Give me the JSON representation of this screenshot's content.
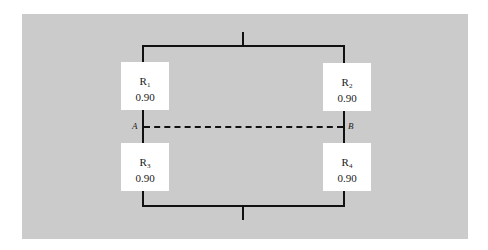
{
  "diagram": {
    "type": "reliability-block-diagram",
    "components": [
      {
        "id": "R1",
        "label": "R",
        "sub": "1",
        "value": "0.90"
      },
      {
        "id": "R2",
        "label": "R",
        "sub": "2",
        "value": "0.90"
      },
      {
        "id": "R3",
        "label": "R",
        "sub": "3",
        "value": "0.90"
      },
      {
        "id": "R4",
        "label": "R",
        "sub": "4",
        "value": "0.90"
      }
    ],
    "nodes": {
      "a": "A",
      "b": "B"
    },
    "colors": {
      "background": "#cbcbcb",
      "wire": "#111111",
      "box": "#ffffff"
    }
  }
}
